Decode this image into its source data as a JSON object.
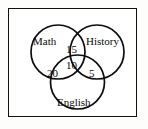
{
  "diagram": {
    "type": "venn",
    "set_count": 3,
    "universe_box": true,
    "stroke_color": "#0d0d0d",
    "background_color": "#ffffff",
    "sets": [
      {
        "id": "math",
        "label": "Math",
        "position": "upper-left"
      },
      {
        "id": "history",
        "label": "History",
        "position": "upper-right"
      },
      {
        "id": "english",
        "label": "English",
        "position": "bottom-center"
      }
    ],
    "regions": [
      {
        "id": "math-history",
        "sets": [
          "math",
          "history"
        ],
        "value": "15"
      },
      {
        "id": "all-three",
        "sets": [
          "math",
          "history",
          "english"
        ],
        "value": "10"
      },
      {
        "id": "math-english",
        "sets": [
          "math",
          "english"
        ],
        "value": "20"
      },
      {
        "id": "history-english",
        "sets": [
          "history",
          "english"
        ],
        "value": "5"
      }
    ]
  }
}
